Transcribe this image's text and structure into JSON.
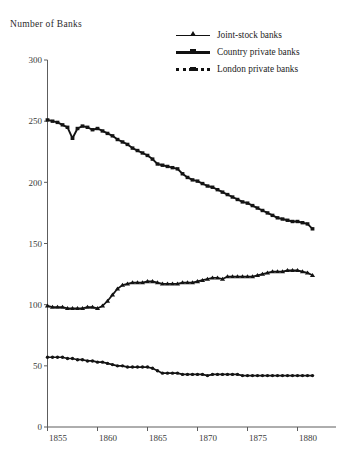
{
  "chart_data": {
    "type": "line",
    "title": "",
    "ylabel": "Number of Banks",
    "xlabel": "",
    "ylim": [
      0,
      300
    ],
    "xlim": [
      1855,
      1882.5
    ],
    "yticks": [
      0,
      50,
      100,
      150,
      200,
      250,
      300
    ],
    "xticks": [
      1855,
      1860,
      1865,
      1870,
      1875,
      1880
    ],
    "grid": false,
    "legend_position": "top-right",
    "x": [
      1855,
      1855.5,
      1856,
      1856.5,
      1857,
      1857.5,
      1858,
      1858.5,
      1859,
      1859.5,
      1860,
      1860.5,
      1861,
      1861.5,
      1862,
      1862.5,
      1863,
      1863.5,
      1864,
      1864.5,
      1865,
      1865.5,
      1866,
      1866.5,
      1867,
      1867.5,
      1868,
      1868.5,
      1869,
      1869.5,
      1870,
      1870.5,
      1871,
      1871.5,
      1872,
      1872.5,
      1873,
      1873.5,
      1874,
      1874.5,
      1875,
      1875.5,
      1876,
      1876.5,
      1877,
      1877.5,
      1878,
      1878.5,
      1879,
      1879.5,
      1880,
      1880.5,
      1881,
      1881.5
    ],
    "series": [
      {
        "name": "Country private banks",
        "marker": "square",
        "values": [
          251,
          250,
          249,
          247,
          245,
          236,
          244,
          246,
          245,
          243,
          244,
          242,
          240,
          238,
          235,
          233,
          231,
          228,
          226,
          224,
          222,
          219,
          215,
          214,
          213,
          212,
          211,
          207,
          204,
          202,
          201,
          199,
          197,
          196,
          194,
          192,
          190,
          188,
          186,
          184,
          183,
          181,
          179,
          177,
          175,
          173,
          171,
          170,
          169,
          168,
          168,
          167,
          166,
          162
        ]
      },
      {
        "name": "Joint-stock banks",
        "marker": "triangle",
        "values": [
          99,
          98,
          98,
          98,
          97,
          97,
          97,
          97,
          98,
          98,
          97,
          99,
          103,
          108,
          113,
          116,
          117,
          118,
          118,
          118,
          119,
          119,
          118,
          117,
          117,
          117,
          117,
          118,
          118,
          118,
          119,
          120,
          121,
          122,
          122,
          121,
          123,
          123,
          123,
          123,
          123,
          123,
          124,
          125,
          126,
          127,
          127,
          127,
          128,
          128,
          128,
          127,
          126,
          124
        ]
      },
      {
        "name": "London private banks",
        "marker": "dot",
        "values": [
          57,
          57,
          57,
          57,
          56,
          56,
          55,
          55,
          54,
          54,
          53,
          53,
          52,
          51,
          50,
          50,
          49,
          49,
          49,
          49,
          49,
          48,
          46,
          44,
          44,
          44,
          44,
          43,
          43,
          43,
          43,
          43,
          42,
          43,
          43,
          43,
          43,
          43,
          43,
          42,
          42,
          42,
          42,
          42,
          42,
          42,
          42,
          42,
          42,
          42,
          42,
          42,
          42,
          42
        ]
      }
    ]
  },
  "legend": {
    "items": [
      {
        "label": "Joint-stock banks",
        "style": "tri"
      },
      {
        "label": "Country private banks",
        "style": "sq"
      },
      {
        "label": "London private banks",
        "style": "dot"
      }
    ]
  },
  "axis": {
    "y_title": "Number  of Banks"
  }
}
